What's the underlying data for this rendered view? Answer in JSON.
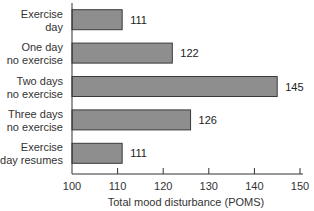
{
  "chart_data": {
    "type": "bar",
    "orientation": "horizontal",
    "title": "",
    "categories": [
      [
        "Exercise",
        "day"
      ],
      [
        "One day",
        "no exercise"
      ],
      [
        "Two days",
        "no exercise"
      ],
      [
        "Three days",
        "no exercise"
      ],
      [
        "Exercise",
        "day resumes"
      ]
    ],
    "values": [
      111,
      122,
      145,
      126,
      111
    ],
    "value_labels": [
      "111",
      "122",
      "145",
      "126",
      "111"
    ],
    "xlabel": "Total mood disturbance (POMS)",
    "ylabel": "",
    "xlim": [
      100,
      150
    ],
    "xticks": [
      100,
      110,
      120,
      130,
      140,
      150
    ],
    "xtick_labels": [
      "100",
      "110",
      "120",
      "130",
      "140",
      "150"
    ],
    "grid": false,
    "legend": "none",
    "bar_color": "#8e8e8e",
    "bar_edge_color": "#3a3a3a"
  }
}
